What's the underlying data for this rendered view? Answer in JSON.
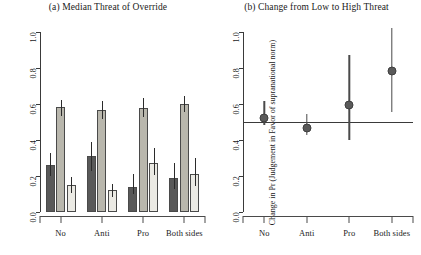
{
  "figure": {
    "panel_a_title": "(a) Median Threat of Override",
    "panel_b_title": "(b) Change from Low to High Threat"
  },
  "chart_data": [
    {
      "type": "bar",
      "panel": "a",
      "title": "(a) Median Threat of Override",
      "xlabel": "",
      "ylabel": "Probability",
      "ylim": [
        0.0,
        1.0
      ],
      "yticks": [
        "0.0",
        "0.2",
        "0.4",
        "0.6",
        "0.8",
        "1.0"
      ],
      "ytick_values": [
        0.0,
        0.2,
        0.4,
        0.6,
        0.8,
        1.0
      ],
      "grid": false,
      "legend": "none",
      "categories": [
        "No",
        "Anti",
        "Pro",
        "Both sides"
      ],
      "series": [
        {
          "name": "series-1-dark",
          "color": "#595959",
          "values": [
            0.26,
            0.31,
            0.14,
            0.19
          ],
          "ci_low": [
            0.2,
            0.23,
            0.1,
            0.13
          ],
          "ci_high": [
            0.33,
            0.39,
            0.21,
            0.27
          ]
        },
        {
          "name": "series-2-mid",
          "color": "#b9b7ad",
          "values": [
            0.585,
            0.565,
            0.58,
            0.6
          ],
          "ci_low": [
            0.535,
            0.515,
            0.525,
            0.555
          ],
          "ci_high": [
            0.625,
            0.615,
            0.635,
            0.645
          ]
        },
        {
          "name": "series-3-light",
          "color": "#ebeae4",
          "values": [
            0.15,
            0.12,
            0.275,
            0.21
          ],
          "ci_low": [
            0.105,
            0.085,
            0.205,
            0.145
          ],
          "ci_high": [
            0.195,
            0.155,
            0.355,
            0.3
          ]
        }
      ]
    },
    {
      "type": "scatter",
      "panel": "b",
      "title": "(b) Change from Low to High Threat",
      "xlabel": "",
      "ylabel": "Change in Pr (Judgement in Favor of supranational norm)",
      "ylim": [
        0.0,
        1.0
      ],
      "yticks": [
        "0.0",
        "0.2",
        "0.4",
        "0.6",
        "0.8",
        "1.0"
      ],
      "ytick_values": [
        0.0,
        0.2,
        0.4,
        0.6,
        0.8,
        1.0
      ],
      "reference_line": 0.5,
      "grid": false,
      "legend": "none",
      "categories": [
        "No",
        "Anti",
        "Pro",
        "Both sides"
      ],
      "values": [
        0.55,
        0.49,
        0.62,
        0.81
      ],
      "ci_low": [
        0.485,
        0.425,
        0.4,
        0.555
      ],
      "ci_high": [
        0.615,
        0.545,
        0.875,
        1.02
      ]
    }
  ]
}
